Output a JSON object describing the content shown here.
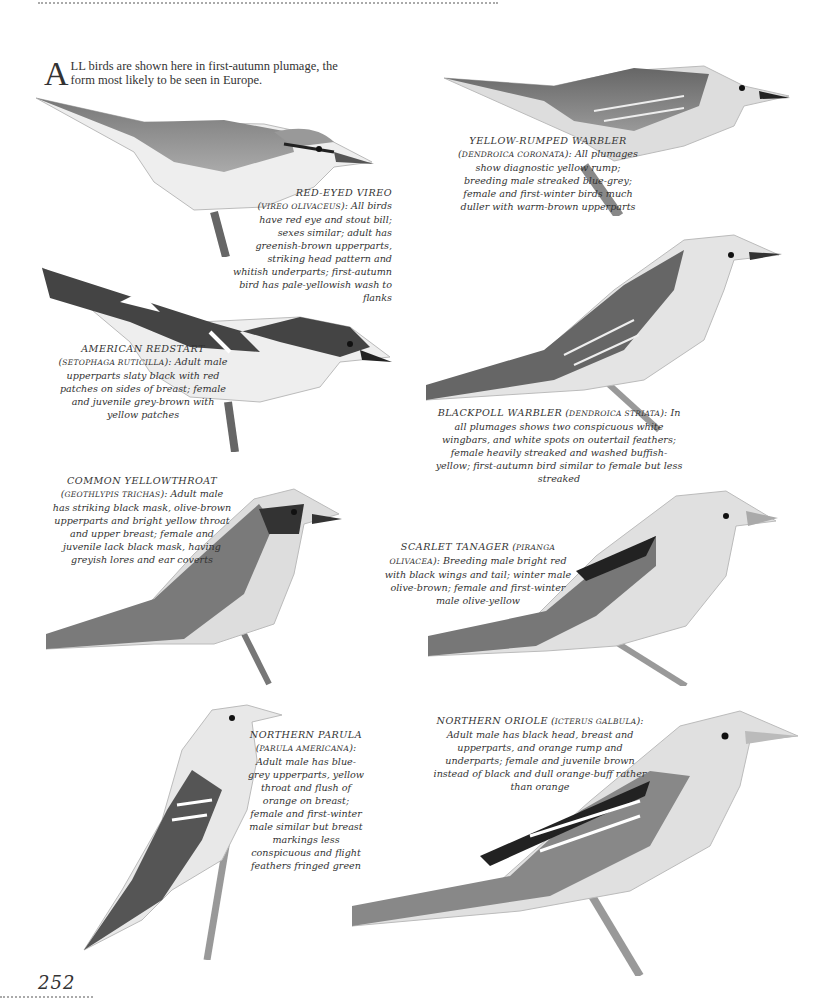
{
  "intro": {
    "dropcap": "A",
    "text": "LL birds are shown here in first-autumn plumage, the form most likely to be seen in Europe."
  },
  "page_number": "252",
  "species": [
    {
      "id": "red-eyed-vireo",
      "name": "RED-EYED VIREO",
      "scientific": "Vireo olivaceus",
      "description": "All birds have red eye and stout bill; sexes similar; adult has greenish-brown upperparts, striking head pattern and whitish underparts; first-autumn bird has pale-yellowish wash to flanks"
    },
    {
      "id": "yellow-rumped-warbler",
      "name": "YELLOW-RUMPED WARBLER",
      "scientific": "Dendroica coronata",
      "description": "All plumages show diagnostic yellow rump; breeding male streaked blue-grey; female and first-winter birds much duller with warm-brown upperparts"
    },
    {
      "id": "american-redstart",
      "name": "AMERICAN REDSTART",
      "scientific": "Setophaga ruticilla",
      "description": "Adult male upperparts slaty black with red patches on sides of breast; female and juvenile grey-brown with yellow patches"
    },
    {
      "id": "blackpoll-warbler",
      "name": "BLACKPOLL WARBLER",
      "scientific": "Dendroica striata",
      "description": "In all plumages shows two conspicuous white wingbars, and white spots on outertail feathers; female heavily streaked and washed buffish-yellow; first-autumn bird similar to female but less streaked"
    },
    {
      "id": "common-yellowthroat",
      "name": "COMMON YELLOWTHROAT",
      "scientific": "Geothlypis trichas",
      "description": "Adult male has striking black mask, olive-brown upperparts and bright yellow throat and upper breast; female and juvenile lack black mask, having greyish lores and ear coverts"
    },
    {
      "id": "scarlet-tanager",
      "name": "SCARLET TANAGER",
      "scientific": "Piranga olivacea",
      "description": "Breeding male bright red with black wings and tail; winter male olive-brown; female and first-winter male olive-yellow"
    },
    {
      "id": "northern-parula",
      "name": "NORTHERN PARULA",
      "scientific": "Parula americana",
      "description": "Adult male has blue-grey upperparts, yellow throat and flush of orange on breast; female and first-winter male similar but breast markings less conspicuous and flight feathers fringed green"
    },
    {
      "id": "northern-oriole",
      "name": "NORTHERN ORIOLE",
      "scientific": "Icterus galbula",
      "description": "Adult male has black head, breast and upperparts, and orange rump and underparts; female and juvenile brown instead of black and dull orange-buff rather than orange"
    }
  ]
}
